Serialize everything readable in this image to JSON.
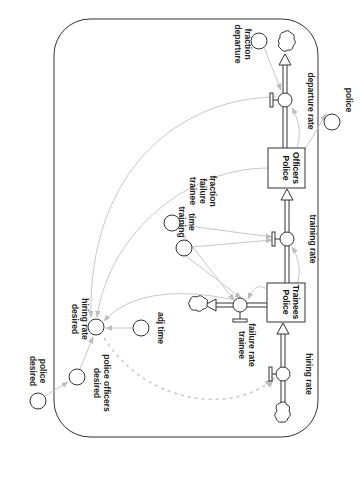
{
  "diagram": {
    "type": "stock-and-flow",
    "orientation": "rotated-90-clockwise",
    "stocks": [
      {
        "id": "police-trainees",
        "label_line1": "Police",
        "label_line2": "Trainees"
      },
      {
        "id": "police-officers",
        "label_line1": "Police",
        "label_line2": "Officers"
      }
    ],
    "flows": [
      {
        "id": "hiring-rate",
        "label": "hiring rate"
      },
      {
        "id": "trainee-failure-rate",
        "label_line1": "trainee",
        "label_line2": "failure rate"
      },
      {
        "id": "training-rate",
        "label": "training rate"
      },
      {
        "id": "departure-rate",
        "label": "departure rate"
      }
    ],
    "auxiliaries": [
      {
        "id": "desired-police",
        "label_line1": "desired",
        "label_line2": "police"
      },
      {
        "id": "desired-police-officers",
        "label_line1": "desired",
        "label_line2": "police officers"
      },
      {
        "id": "desired-hiring-rate",
        "label_line1": "desired",
        "label_line2": "hiring rate"
      },
      {
        "id": "adj-time",
        "label": "adj time"
      },
      {
        "id": "training-time",
        "label_line1": "training",
        "label_line2": "time"
      },
      {
        "id": "trainee-failure-fraction",
        "label_line1": "trainee",
        "label_line2": "failure",
        "label_line3": "fraction"
      },
      {
        "id": "departure-fraction",
        "label_line1": "departure",
        "label_line2": "fraction"
      },
      {
        "id": "police",
        "label": "police"
      }
    ],
    "links": [
      {
        "from": "desired police",
        "to": "desired police officers"
      },
      {
        "from": "desired police officers",
        "to": "desired hiring rate"
      },
      {
        "from": "adj time",
        "to": "desired hiring rate"
      },
      {
        "from": "Police Trainees",
        "to": "desired hiring rate"
      },
      {
        "from": "Police Officers",
        "to": "desired hiring rate"
      },
      {
        "from": "departure rate",
        "to": "desired hiring rate"
      },
      {
        "from": "trainee failure rate",
        "to": "desired hiring rate"
      },
      {
        "from": "desired hiring rate",
        "to": "hiring rate",
        "style": "dashed"
      },
      {
        "from": "training time",
        "to": "trainee failure rate"
      },
      {
        "from": "trainee failure fraction",
        "to": "trainee failure rate"
      },
      {
        "from": "Police Trainees",
        "to": "trainee failure rate"
      },
      {
        "from": "training time",
        "to": "training rate"
      },
      {
        "from": "trainee failure fraction",
        "to": "training rate"
      },
      {
        "from": "Police Trainees",
        "to": "training rate"
      },
      {
        "from": "Police Officers",
        "to": "departure rate"
      },
      {
        "from": "departure fraction",
        "to": "departure rate"
      },
      {
        "from": "Police Officers",
        "to": "police"
      }
    ]
  }
}
